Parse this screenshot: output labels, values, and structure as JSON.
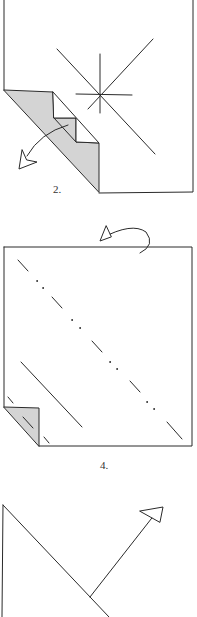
{
  "diagram": {
    "steps": [
      {
        "label": "2.",
        "description": "Fold corner flap with stepped crease; star marks reference point"
      },
      {
        "label": "4.",
        "description": "Turn over; valley and mountain fold diagonals"
      },
      {
        "label": "",
        "description": "Fold diagonal edge upward along arrow"
      }
    ]
  },
  "colors": {
    "line": "#2a2a2a",
    "flap_fill": "#d4d4d4",
    "background": "#ffffff"
  },
  "icons": {
    "step2_arrow": "curved-arrow-left-down",
    "step4_arrow": "turn-over-arrow",
    "step5_arrow": "straight-arrow-up-right"
  }
}
